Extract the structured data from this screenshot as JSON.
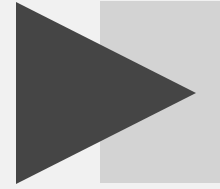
{
  "canvas": {
    "width": 220,
    "height": 189,
    "background": "#f1f1f1"
  },
  "shapes": {
    "rectangle": {
      "x": 100,
      "y": 1,
      "width": 120,
      "height": 182,
      "fill": "#d3d3d3"
    },
    "triangle": {
      "points": "16,2 196,93 16,184",
      "fill": "#454545",
      "direction": "right"
    }
  }
}
